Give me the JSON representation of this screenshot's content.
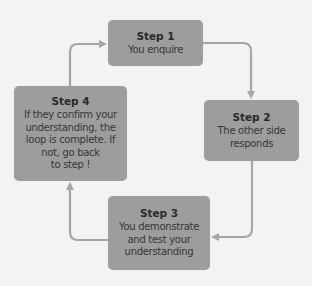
{
  "diagram": {
    "type": "cycle",
    "colors": {
      "background": "#f3f3f3",
      "box_fill": "#9d9d9d",
      "arrow": "#a6a6a6",
      "title_text": "#2a2a2a",
      "body_text": "#363636"
    },
    "steps": [
      {
        "title": "Step 1",
        "body": "You enquire"
      },
      {
        "title": "Step 2",
        "body": "The other side\nresponds"
      },
      {
        "title": "Step 3",
        "body": "You demonstrate\nand test your\nunderstanding"
      },
      {
        "title": "Step 4",
        "body": "If they confirm your\nunderstanding, the\nloop is complete. If\nnot, go back\nto step !"
      }
    ],
    "arrows": [
      {
        "from": "Step 1",
        "to": "Step 2"
      },
      {
        "from": "Step 2",
        "to": "Step 3"
      },
      {
        "from": "Step 3",
        "to": "Step 4"
      },
      {
        "from": "Step 4",
        "to": "Step 1"
      }
    ]
  }
}
